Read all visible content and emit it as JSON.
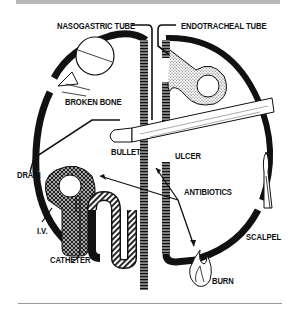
{
  "figure": {
    "type": "medical-illustration",
    "labels": {
      "nasogastric_tube": "NASOGASTRIC TUBE",
      "endotracheal_tube": "ENDOTRACHEAL TUBE",
      "broken_bone": "BROKEN BONE",
      "bullet": "BULLET",
      "ulcer": "ULCER",
      "drain": "DRAIN",
      "antibiotics": "ANTIBIOTICS",
      "iv": "I.V.",
      "catheter": "CATHETER",
      "scalpel": "SCALPEL",
      "burn": "BURN"
    },
    "colors": {
      "ink": "#111111",
      "background": "#ffffff",
      "rule": "#b8b8b8"
    }
  }
}
